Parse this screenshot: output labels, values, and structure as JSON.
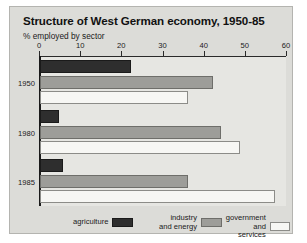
{
  "chart_data": {
    "type": "bar",
    "orientation": "horizontal",
    "title": "Structure of West German economy, 1950-85",
    "subtitle": "% employed by sector",
    "xlabel": "",
    "ylabel": "",
    "xlim": [
      0,
      60
    ],
    "xticks": [
      0,
      10,
      20,
      30,
      40,
      50,
      60
    ],
    "xtick_labels": [
      "0",
      "10",
      "20",
      "30",
      "40",
      "50",
      "60"
    ],
    "grid": false,
    "legend_position": "bottom",
    "categories": [
      "1950",
      "1980",
      "1985"
    ],
    "series": [
      {
        "name": "agriculture",
        "color": "#2e2e2e",
        "values": [
          22,
          4.5,
          5.5
        ]
      },
      {
        "name": "industry and energy",
        "color": "#9d9d99",
        "values": [
          42,
          44,
          36
        ]
      },
      {
        "name": "government and services",
        "color": "#f7f7f4",
        "values": [
          36,
          48.5,
          57
        ]
      }
    ]
  },
  "legend": {
    "items": [
      {
        "label": "agriculture",
        "swatch": "agri"
      },
      {
        "label_line1": "industry",
        "label_line2": "and energy",
        "swatch": "ind"
      },
      {
        "label_line1": "government",
        "label_line2": "and services",
        "swatch": "gov"
      }
    ]
  }
}
